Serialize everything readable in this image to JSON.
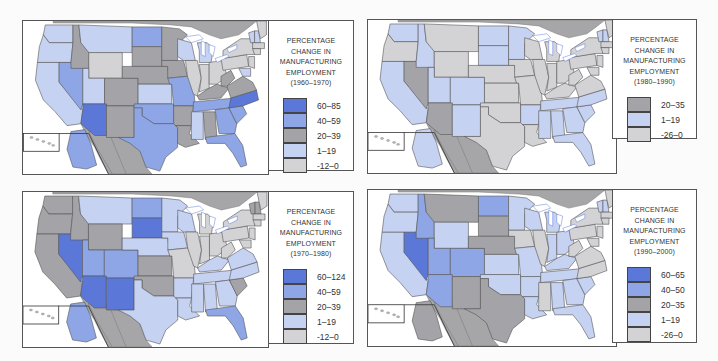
{
  "colors": {
    "c60": "#5b78d8",
    "c40": "#8ea6e6",
    "c20": "#a4a4a8",
    "c1": "#c5d2f2",
    "cneg": "#d3d3d6",
    "foreign": "#a8a8aa"
  },
  "panels": [
    {
      "id": "1960-1970",
      "legend": {
        "title_lines": [
          "PERCENTAGE",
          "CHANGE IN",
          "MANUFACTURING",
          "EMPLOYMENT",
          "(1960–1970)"
        ],
        "items": [
          {
            "label": "60–85",
            "color": "#5b78d8"
          },
          {
            "label": "40–59",
            "color": "#8ea6e6"
          },
          {
            "label": "20–39",
            "color": "#a4a4a8"
          },
          {
            "label": "1–19",
            "color": "#c5d2f2"
          },
          {
            "label": "-12–0",
            "color": "#d3d3d6"
          }
        ]
      }
    },
    {
      "id": "1980-1990",
      "legend": {
        "title_lines": [
          "PERCENTAGE",
          "CHANGE IN",
          "MANUFACTURING",
          "EMPLOYMENT",
          "(1980–1990)"
        ],
        "items": [
          {
            "label": "20–35",
            "color": "#a4a4a8"
          },
          {
            "label": "1–19",
            "color": "#c5d2f2"
          },
          {
            "label": "-26–0",
            "color": "#d3d3d6"
          }
        ]
      }
    },
    {
      "id": "1970-1980",
      "legend": {
        "title_lines": [
          "PERCENTAGE",
          "CHANGE IN",
          "MANUFACTURING",
          "EMPLOYMENT",
          "(1970–1980)"
        ],
        "items": [
          {
            "label": "60–124",
            "color": "#5b78d8"
          },
          {
            "label": "40–59",
            "color": "#8ea6e6"
          },
          {
            "label": "20–39",
            "color": "#a4a4a8"
          },
          {
            "label": "1–19",
            "color": "#c5d2f2"
          },
          {
            "label": "-12–0",
            "color": "#d3d3d6"
          }
        ]
      }
    },
    {
      "id": "1990-2000",
      "legend": {
        "title_lines": [
          "PERCENTAGE",
          "CHANGE IN",
          "MANUFACTURING",
          "EMPLOYMENT",
          "(1990–2000)"
        ],
        "items": [
          {
            "label": "60–65",
            "color": "#5b78d8"
          },
          {
            "label": "40–50",
            "color": "#8ea6e6"
          },
          {
            "label": "20–35",
            "color": "#a4a4a8"
          },
          {
            "label": "1–19",
            "color": "#c5d2f2"
          },
          {
            "label": "-26–0",
            "color": "#d3d3d6"
          }
        ]
      }
    }
  ],
  "state_classes": {
    "1960-1970": {
      "WA": "c1",
      "OR": "c1",
      "CA": "c1",
      "NV": "c40",
      "ID": "c20",
      "MT": "c1",
      "WY": "cneg",
      "UT": "c1",
      "AZ": "c60",
      "CO": "c20",
      "NM": "c20",
      "ND": "c40",
      "SD": "c20",
      "NE": "c20",
      "KS": "c1",
      "OK": "c40",
      "TX": "c40",
      "MN": "c20",
      "IA": "c20",
      "MO": "c40",
      "AR": "c20",
      "LA": "c20",
      "WI": "c1",
      "IL": "cneg",
      "MI": "c1",
      "IN": "cneg",
      "OH": "cneg",
      "KY": "c20",
      "TN": "c40",
      "MS": "c1",
      "AL": "c20",
      "GA": "c40",
      "FL": "c40",
      "SC": "c40",
      "NC": "c60",
      "VA": "c20",
      "WV": "c20",
      "PA": "cneg",
      "NY": "cneg",
      "VT": "c1",
      "NH": "c1",
      "ME": "cneg",
      "MA": "cneg",
      "CT": "cneg",
      "NJ": "cneg",
      "MD": "c1",
      "AK": "c40"
    },
    "1980-1990": {
      "WA": "c1",
      "OR": "cneg",
      "CA": "c1",
      "NV": "c20",
      "ID": "c1",
      "MT": "cneg",
      "WY": "cneg",
      "UT": "c1",
      "AZ": "c20",
      "CO": "c1",
      "NM": "c1",
      "ND": "c1",
      "SD": "c1",
      "NE": "cneg",
      "KS": "cneg",
      "OK": "cneg",
      "TX": "cneg",
      "MN": "c1",
      "IA": "cneg",
      "MO": "cneg",
      "AR": "c1",
      "LA": "cneg",
      "WI": "cneg",
      "IL": "cneg",
      "MI": "cneg",
      "IN": "cneg",
      "OH": "cneg",
      "KY": "cneg",
      "TN": "c1",
      "MS": "c1",
      "AL": "c1",
      "GA": "c1",
      "FL": "c1",
      "SC": "c1",
      "NC": "c1",
      "VA": "cneg",
      "WV": "cneg",
      "PA": "cneg",
      "NY": "cneg",
      "VT": "c1",
      "NH": "c1",
      "ME": "cneg",
      "MA": "cneg",
      "CT": "cneg",
      "NJ": "cneg",
      "MD": "cneg",
      "AK": "c1"
    },
    "1970-1980": {
      "WA": "c20",
      "OR": "c20",
      "CA": "c20",
      "NV": "c60",
      "ID": "c20",
      "MT": "c1",
      "WY": "c20",
      "UT": "c40",
      "AZ": "c60",
      "CO": "c40",
      "NM": "c60",
      "ND": "c40",
      "SD": "c60",
      "NE": "c1",
      "KS": "c20",
      "OK": "c20",
      "TX": "c1",
      "MN": "c1",
      "IA": "c1",
      "MO": "cneg",
      "AR": "c1",
      "LA": "c1",
      "WI": "c1",
      "IL": "cneg",
      "MI": "cneg",
      "IN": "cneg",
      "OH": "cneg",
      "KY": "c1",
      "TN": "c1",
      "MS": "c1",
      "AL": "c1",
      "GA": "c1",
      "FL": "c40",
      "SC": "c20",
      "NC": "c1",
      "VA": "c1",
      "WV": "cneg",
      "PA": "cneg",
      "NY": "cneg",
      "VT": "c20",
      "NH": "c20",
      "ME": "cneg",
      "MA": "cneg",
      "CT": "cneg",
      "NJ": "cneg",
      "MD": "cneg",
      "AK": "c40"
    },
    "1990-2000": {
      "WA": "c1",
      "OR": "c1",
      "CA": "c1",
      "NV": "c60",
      "ID": "c40",
      "MT": "c20",
      "WY": "c1",
      "UT": "c40",
      "AZ": "c40",
      "CO": "c40",
      "NM": "c20",
      "ND": "c40",
      "SD": "c20",
      "NE": "c20",
      "KS": "c1",
      "OK": "c1",
      "TX": "c20",
      "MN": "c1",
      "IA": "cneg",
      "MO": "c1",
      "AR": "c1",
      "LA": "c1",
      "WI": "c1",
      "IL": "cneg",
      "MI": "c1",
      "IN": "c1",
      "OH": "c1",
      "KY": "c1",
      "TN": "c1",
      "MS": "cneg",
      "AL": "c1",
      "GA": "c1",
      "FL": "c1",
      "SC": "c1",
      "NC": "cneg",
      "VA": "cneg",
      "WV": "cneg",
      "PA": "cneg",
      "NY": "cneg",
      "VT": "c1",
      "NH": "c1",
      "ME": "cneg",
      "MA": "cneg",
      "CT": "cneg",
      "NJ": "cneg",
      "MD": "cneg",
      "AK": "c20"
    }
  }
}
